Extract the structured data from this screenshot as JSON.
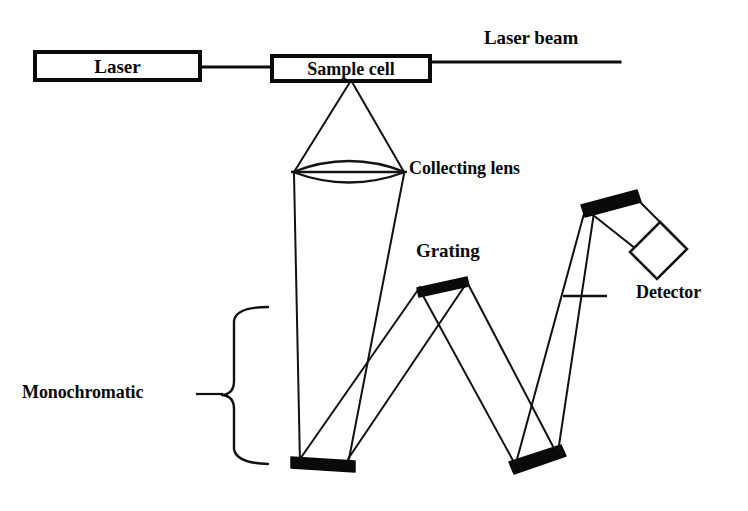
{
  "diagram": {
    "background_color": "#ffffff",
    "ink_color": "#0a0a0a",
    "components": {
      "laser": {
        "label": "Laser",
        "shape": "rectangle-box"
      },
      "sample_cell": {
        "label": "Sample cell",
        "shape": "rectangle-box"
      },
      "laser_beam": {
        "label": "Laser beam",
        "shape": "horizontal-line"
      },
      "collecting_lens": {
        "label": "Collecting lens",
        "shape": "biconvex-lens"
      },
      "grating": {
        "label": "Grating",
        "shape": "tilted-black-bar"
      },
      "detector": {
        "label": "Detector",
        "shape": "tilted-open-rectangle"
      },
      "monochromator": {
        "label": "Monochromatic",
        "shape": "curly-brace-group"
      },
      "mirror_left": {
        "label": "",
        "shape": "black-bar-horizontal"
      },
      "mirror_right": {
        "label": "",
        "shape": "black-bar-tilted"
      },
      "mirror_top_right": {
        "label": "",
        "shape": "black-bar-tilted"
      },
      "slit": {
        "label": "",
        "shape": "cross-tick"
      }
    }
  }
}
